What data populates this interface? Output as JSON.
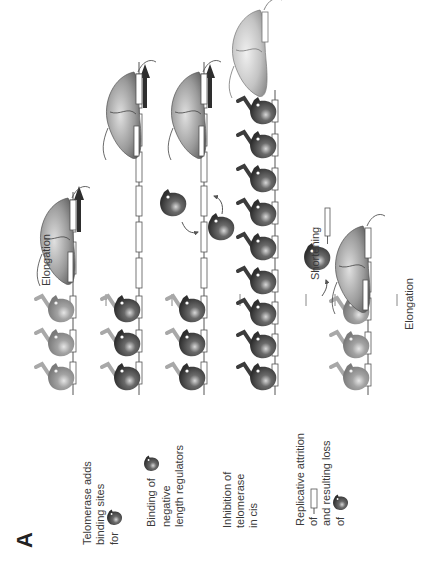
{
  "figure": {
    "panel_label": "A",
    "orientation": "rotated 90° counter-clockwise",
    "rows": [
      {
        "id": "row-1",
        "label_lines": [
          "Telomerase adds",
          "binding sites",
          "for"
        ],
        "label_icon": "negative-regulator-protein-icon",
        "stage_label": "Elongation",
        "regulators_bound": 3,
        "regulator_shade": "light",
        "repeats_total": 4,
        "telomerase_bound": true
      },
      {
        "id": "row-2",
        "label_lines": [
          "Binding of",
          "negative",
          "length regulators"
        ],
        "label_icon": "negative-regulator-protein-icon",
        "stage_label": "",
        "regulators_bound": 3,
        "regulator_shade": "dark-with-light-tail",
        "repeats_total": 7,
        "telomerase_bound": true
      },
      {
        "id": "row-3",
        "label_lines": [
          "Inhibition of",
          "telomerase",
          "in cis"
        ],
        "label_icon": "",
        "stage_label": "",
        "regulators_bound": 3,
        "free_regulators": 2,
        "regulator_shade": "dark-with-light-tail",
        "repeats_total": 7,
        "telomerase_bound": true
      },
      {
        "id": "row-4",
        "label_lines": [],
        "label_icon": "",
        "stage_label": "",
        "regulators_bound": 9,
        "regulator_shade": "dark",
        "repeats_total": 9,
        "telomerase_bound": false,
        "telomerase_detached": true
      },
      {
        "id": "row-5",
        "label_lines": [
          "Replicative attrition",
          "of",
          "and resulting loss",
          "of"
        ],
        "label_icons": [
          "repeat-segment-icon",
          "negative-regulator-protein-icon"
        ],
        "stage_label": "Elongation",
        "pre_stage_label": "Shortening",
        "regulators_bound": 3,
        "regulator_shade": "light",
        "repeats_total": 4,
        "telomerase_bound": true,
        "released_repeat": true,
        "released_regulator": true
      }
    ],
    "colors": {
      "dark_protein": "#4a4a4a",
      "light_protein": "#9a9a9a",
      "telomerase": "#8c8c8c",
      "dna_line": "#555555",
      "arrow": "#888888",
      "text": "#3a3a3a"
    }
  }
}
